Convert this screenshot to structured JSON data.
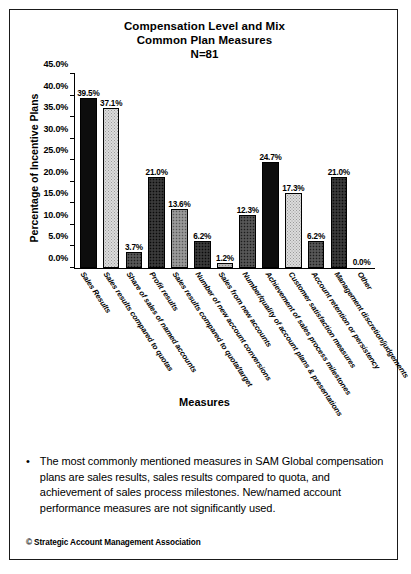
{
  "slide": {
    "title_line1": "Compensation Level and Mix",
    "title_line2": "Common Plan Measures",
    "sample_size": "N=81",
    "copyright": "© Strategic Account Management Association",
    "note_bullet": "•",
    "note_text": "The most commonly mentioned measures in SAM Global compensation plans are sales results, sales results compared to quota, and achievement of sales process milestones. New/named account performance measures are not significantly used."
  },
  "chart_data": {
    "type": "bar",
    "title": "Compensation Level and Mix Common Plan Measures N=81",
    "xlabel": "Measures",
    "ylabel": "Percentage of Incentive Plans",
    "ylim": [
      0,
      45
    ],
    "ytick_labels": [
      "0.0%",
      "5.0%",
      "10.0%",
      "15.0%",
      "20.0%",
      "25.0%",
      "30.0%",
      "35.0%",
      "40.0%",
      "45.0%"
    ],
    "ytick_values": [
      0,
      5,
      10,
      15,
      20,
      25,
      30,
      35,
      40,
      45
    ],
    "grid": false,
    "legend": "none",
    "categories": [
      "Sales Results",
      "Sales results compared to quotas",
      "Share of sales of named accounts",
      "Profit results",
      "Sales results compared to quota/target",
      "Number of new account conversions",
      "Sales from new accounts",
      "Number/quality of account plans & presentations",
      "Achievement of sales process milestones",
      "Customer satisfaction measures",
      "Account retention or persistency",
      "Management discretion/judgements",
      "Other"
    ],
    "values": [
      39.5,
      37.1,
      3.7,
      21.0,
      13.6,
      6.2,
      1.2,
      12.3,
      24.7,
      17.3,
      6.2,
      21.0,
      0.0
    ],
    "value_labels": [
      "39.5%",
      "37.1%",
      "3.7%",
      "21.0%",
      "13.6%",
      "6.2%",
      "1.2%",
      "12.3%",
      "24.7%",
      "17.3%",
      "6.2%",
      "21.0%",
      "0.0%"
    ],
    "fills": [
      "black",
      "light",
      "dark",
      "verydark",
      "mid",
      "verydark",
      "pale",
      "dark",
      "black",
      "light",
      "dark",
      "verydark",
      "none"
    ],
    "colors": {
      "black": "#0d0d0d",
      "light": "#dcdcdc",
      "dark": "#4a4a4a",
      "mid": "#8c8c8c",
      "verydark": "#2e2e2e",
      "pale": "#b8b8b8",
      "axis": "#000000",
      "background": "#ffffff"
    }
  }
}
